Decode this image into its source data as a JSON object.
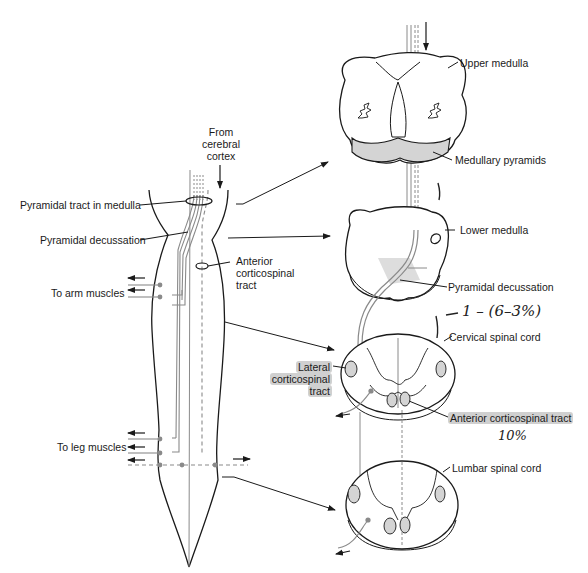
{
  "figure": {
    "left_panel": {
      "labels": {
        "from_cortex": [
          "From",
          "cerebral",
          "cortex"
        ],
        "pyramidal_tract_medulla": "Pyramidal tract in medulla",
        "pyramidal_decussation": "Pyramidal decussation",
        "anterior_cst": [
          "Anterior",
          "corticospinal",
          "tract"
        ],
        "arm_muscles": "To arm muscles",
        "leg_muscles": "To leg muscles"
      }
    },
    "right_panel": {
      "sections": [
        {
          "id": "upper-medulla",
          "label": "Upper medulla"
        },
        {
          "id": "lower-medulla",
          "label": "Lower medulla"
        },
        {
          "id": "cervical-cord",
          "label": "Cervical spinal cord"
        },
        {
          "id": "lumbar-cord",
          "label": "Lumbar spinal cord"
        }
      ],
      "labels": {
        "medullary_pyramids": "Medullary pyramids",
        "pyramidal_decussation": "Pyramidal decussation",
        "lateral_cst": [
          "Lateral",
          "corticospinal",
          "tract"
        ],
        "anterior_cst": "Anterior corticospinal tract"
      }
    },
    "handwritten_notes": {
      "decussation_note": "1 – (6–3%)",
      "anterior_note": "10%",
      "tick_marks": [
        "|",
        "|"
      ]
    },
    "colors": {
      "line": "#1a1a1a",
      "tract_gray": "#8a8a8a",
      "pyramid_fill": "#d4d4d4",
      "highlight": "#9a9a9a"
    }
  }
}
